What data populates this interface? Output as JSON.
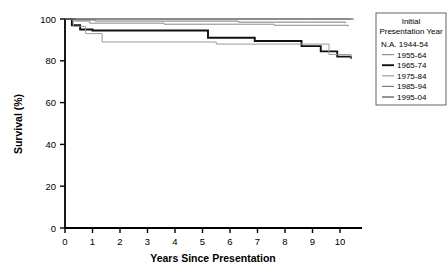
{
  "chart_data": {
    "type": "line",
    "subtype": "kaplan-meier-step",
    "title": "",
    "xlabel": "Years Since Presentation",
    "ylabel": "Survival (%)",
    "xlim": [
      0,
      10.8
    ],
    "ylim": [
      0,
      100
    ],
    "xticks": [
      0,
      1,
      2,
      3,
      4,
      5,
      6,
      7,
      8,
      9,
      10
    ],
    "xtick_labels": [
      "0",
      "1",
      "2",
      "3",
      "4",
      "5",
      "6",
      "7",
      "8",
      "9",
      "10"
    ],
    "yticks": [
      0,
      20,
      40,
      60,
      80,
      100
    ],
    "ytick_labels": [
      "0",
      "20",
      "40",
      "60",
      "80",
      "100"
    ],
    "grid": false,
    "legend_position": "top-right",
    "series": [
      {
        "name": "N.A. 1944-54",
        "has_line_sample": false,
        "stroke": "#999999",
        "width": 1.0,
        "x": [
          0,
          10.4
        ],
        "y": [
          100,
          100
        ],
        "final_value": 100
      },
      {
        "name": "1955-64",
        "has_line_sample": true,
        "stroke": "#8c8c8c",
        "width": 1.0,
        "x": [
          0,
          0.35,
          0.9,
          2.5,
          3.6,
          6.1,
          7.6,
          9.6,
          10.3
        ],
        "y": [
          100,
          99,
          98,
          98,
          97.5,
          97.5,
          97,
          97,
          96.5
        ],
        "final_value": 96.5
      },
      {
        "name": "1965-74",
        "has_line_sample": true,
        "stroke": "#111111",
        "width": 1.9,
        "x": [
          0,
          0.25,
          0.55,
          1.0,
          5.2,
          6.9,
          8.6,
          9.3,
          9.9,
          10.4
        ],
        "y": [
          100,
          97,
          95,
          94.5,
          91,
          89.5,
          87,
          84.5,
          82,
          81
        ],
        "final_value": 81
      },
      {
        "name": "1975-84",
        "has_line_sample": true,
        "stroke": "#9a9a9a",
        "width": 1.0,
        "x": [
          0,
          0.3,
          0.75,
          1.35,
          5.5,
          9.6,
          10.4
        ],
        "y": [
          100,
          96.5,
          93,
          89,
          88,
          83,
          81
        ],
        "final_value": 81
      },
      {
        "name": "1985-94",
        "has_line_sample": true,
        "stroke": "#7a7a7a",
        "width": 1.0,
        "x": [
          0,
          0.4,
          1.1,
          3.1,
          6.3,
          8.9,
          10.2
        ],
        "y": [
          100,
          99.5,
          99,
          99,
          98.5,
          98.5,
          98
        ],
        "final_value": 98
      },
      {
        "name": "1995-04",
        "has_line_sample": true,
        "stroke": "#4d4d4d",
        "width": 1.1,
        "x": [
          0,
          10.5
        ],
        "y": [
          100,
          100
        ],
        "final_value": 100
      }
    ]
  },
  "legend": {
    "title_line1": "Initial",
    "title_line2": "Presentation Year",
    "entries": [
      "N.A. 1944-54",
      "1955-64",
      "1965-74",
      "1975-84",
      "1985-94",
      "1995-04"
    ]
  },
  "axes": {
    "x_title": "Years Since Presentation",
    "y_title": "Survival (%)"
  }
}
